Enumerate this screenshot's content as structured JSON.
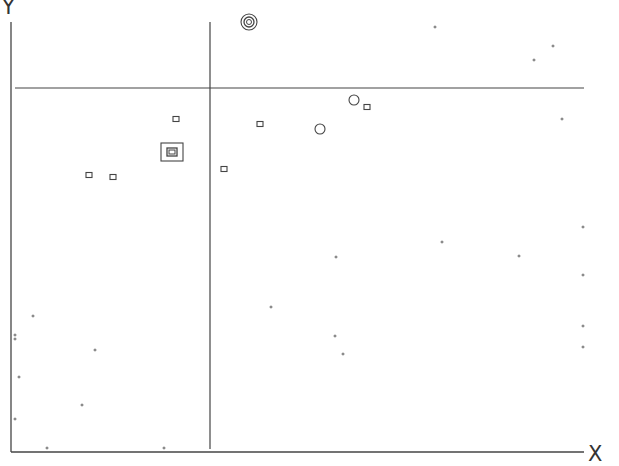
{
  "chart_data": {
    "type": "scatter",
    "title": "",
    "xlabel": "X",
    "ylabel": "Y",
    "grid": false,
    "legend": null,
    "axes": {
      "origin_px": [
        11,
        452
      ],
      "x_end_px": 584,
      "y_top_px": 22,
      "color": "#444444"
    },
    "dividers": {
      "vertical": {
        "x": 210,
        "y1": 22,
        "y2": 449
      },
      "horizontal": {
        "y": 88,
        "x1": 15,
        "x2": 584
      }
    },
    "series": [
      {
        "name": "dots",
        "marker": "dot",
        "color": "#888888",
        "points": [
          [
            435,
            27
          ],
          [
            553,
            46
          ],
          [
            534,
            60
          ],
          [
            562,
            119
          ],
          [
            583,
            227
          ],
          [
            442,
            242
          ],
          [
            519,
            256
          ],
          [
            336,
            257
          ],
          [
            583,
            275
          ],
          [
            271,
            307
          ],
          [
            33,
            316
          ],
          [
            583,
            326
          ],
          [
            15,
            335
          ],
          [
            335,
            336
          ],
          [
            15,
            339
          ],
          [
            583,
            347
          ],
          [
            95,
            350
          ],
          [
            343,
            354
          ],
          [
            19,
            377
          ],
          [
            82,
            405
          ],
          [
            15,
            419
          ],
          [
            47,
            448
          ],
          [
            164,
            448
          ]
        ]
      },
      {
        "name": "squares",
        "marker": "square",
        "color": "#444444",
        "points": [
          [
            176,
            119
          ],
          [
            260,
            124
          ],
          [
            367,
            107
          ],
          [
            224,
            169
          ],
          [
            89,
            175
          ],
          [
            113,
            177
          ]
        ]
      },
      {
        "name": "circles",
        "marker": "circle",
        "color": "#444444",
        "points": [
          [
            354,
            100
          ],
          [
            320,
            129
          ]
        ]
      },
      {
        "name": "nested-square",
        "marker": "nested-square",
        "color": "#444444",
        "points": [
          [
            172,
            152
          ]
        ]
      },
      {
        "name": "concentric-circle",
        "marker": "concentric-circle",
        "color": "#444444",
        "points": [
          [
            249,
            22
          ]
        ]
      }
    ]
  }
}
